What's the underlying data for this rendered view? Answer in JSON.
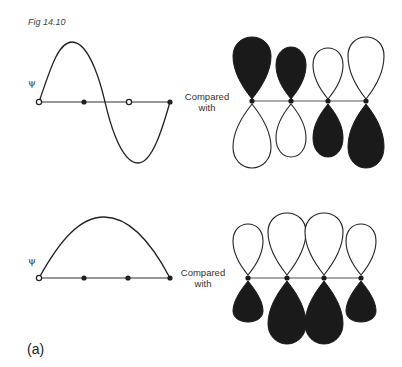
{
  "figure": {
    "title": "Fig 14.10",
    "panel_label": "(a)",
    "rows": [
      {
        "id": "row-1",
        "psi_label": "ψ",
        "wave": "sine-full-period",
        "compare_label_line1": "Compared",
        "compare_label_line2": "with",
        "orbitals": [
          {
            "top": "filled",
            "bottom": "open",
            "top_size": "large",
            "bottom_size": "large"
          },
          {
            "top": "filled",
            "bottom": "open",
            "top_size": "small",
            "bottom_size": "small"
          },
          {
            "top": "open",
            "bottom": "filled",
            "top_size": "small",
            "bottom_size": "small"
          },
          {
            "top": "open",
            "bottom": "filled",
            "top_size": "large",
            "bottom_size": "large"
          }
        ]
      },
      {
        "id": "row-2",
        "psi_label": "ψ",
        "wave": "half-sine-arch",
        "compare_label_line1": "Compared",
        "compare_label_line2": "with",
        "orbitals": [
          {
            "top": "open",
            "bottom": "filled",
            "top_size": "small",
            "bottom_size": "small"
          },
          {
            "top": "open",
            "bottom": "filled",
            "top_size": "large",
            "bottom_size": "large"
          },
          {
            "top": "open",
            "bottom": "filled",
            "top_size": "large",
            "bottom_size": "large"
          },
          {
            "top": "open",
            "bottom": "filled",
            "top_size": "small",
            "bottom_size": "small"
          }
        ]
      }
    ],
    "colors": {
      "ink": "#1a1a1a",
      "background": "#ffffff"
    }
  }
}
